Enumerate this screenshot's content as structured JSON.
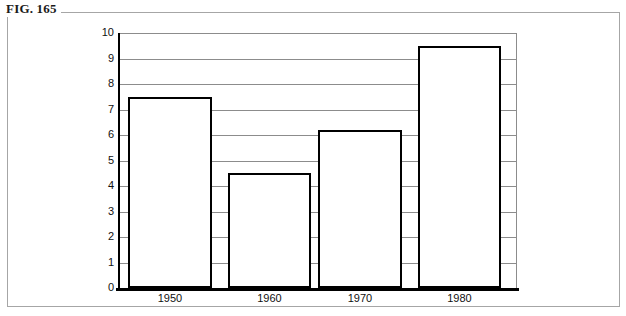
{
  "figure": {
    "label": "FIG. 165"
  },
  "chart_data": {
    "type": "bar",
    "title": "",
    "subtitle": "",
    "xlabel": "",
    "ylabel": "",
    "categories": [
      "1950",
      "1960",
      "1970",
      "1980"
    ],
    "values": [
      7.5,
      4.5,
      6.2,
      9.5
    ],
    "series": [
      {
        "name": "",
        "values": [
          7.5,
          4.5,
          6.2,
          9.5
        ]
      }
    ],
    "ylim": [
      0,
      10
    ],
    "yticks": [
      "0",
      "1",
      "2",
      "3",
      "4",
      "5",
      "6",
      "7",
      "8",
      "9",
      "10"
    ],
    "ytick_values": [
      0,
      1,
      2,
      3,
      4,
      5,
      6,
      7,
      8,
      9,
      10
    ],
    "grid": true,
    "grid_axis": "y",
    "legend": false,
    "legend_position": "none",
    "bar_style": "outline",
    "bar_fill_color": "#ffffff",
    "bar_edge_color": "#000000",
    "gridline_color": "#8c8c8c",
    "axis_color": "#000000",
    "background_color": "#ffffff",
    "annotations": []
  }
}
